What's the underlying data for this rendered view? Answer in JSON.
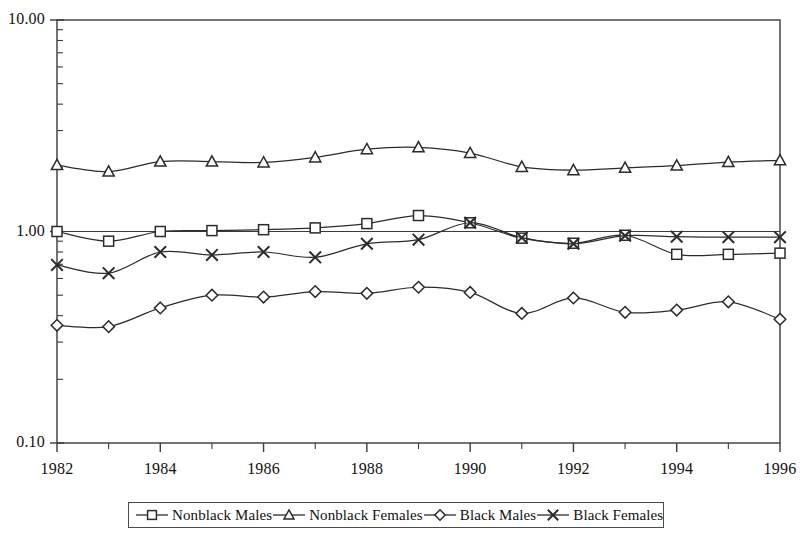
{
  "chart_data": {
    "type": "line",
    "title": "",
    "subtitle": "",
    "xlabel": "",
    "ylabel": "",
    "yscale": "log",
    "ylim": [
      0.1,
      10.0
    ],
    "ytick_labels": [
      "10.00",
      "1.00",
      "0.10"
    ],
    "ytick_values": [
      10.0,
      1.0,
      0.1
    ],
    "xlim": [
      1982,
      1996
    ],
    "x": [
      1982,
      1983,
      1984,
      1985,
      1986,
      1987,
      1988,
      1989,
      1990,
      1991,
      1992,
      1993,
      1994,
      1995,
      1996
    ],
    "xtick_labels": [
      "1982",
      "1984",
      "1986",
      "1988",
      "1990",
      "1992",
      "1994",
      "1996"
    ],
    "xtick_values": [
      1982,
      1984,
      1986,
      1988,
      1990,
      1992,
      1994,
      1996
    ],
    "grid": false,
    "legend_position": "bottom",
    "reference_line": 1.0,
    "series": [
      {
        "name": "Nonblack Males",
        "marker": "square",
        "values": [
          1.0,
          0.9,
          1.0,
          1.01,
          1.02,
          1.04,
          1.09,
          1.19,
          1.1,
          0.93,
          0.88,
          0.96,
          0.78,
          0.78,
          0.79
        ]
      },
      {
        "name": "Nonblack Females",
        "marker": "triangle",
        "values": [
          2.06,
          1.92,
          2.14,
          2.14,
          2.12,
          2.24,
          2.45,
          2.5,
          2.35,
          2.02,
          1.95,
          2.0,
          2.05,
          2.13,
          2.17
        ]
      },
      {
        "name": "Black Males",
        "marker": "diamond",
        "values": [
          0.36,
          0.355,
          0.435,
          0.5,
          0.49,
          0.52,
          0.51,
          0.545,
          0.515,
          0.41,
          0.485,
          0.415,
          0.425,
          0.465,
          0.385
        ]
      },
      {
        "name": "Black Females",
        "marker": "cross",
        "values": [
          0.695,
          0.635,
          0.8,
          0.775,
          0.8,
          0.755,
          0.875,
          0.915,
          1.1,
          0.935,
          0.875,
          0.955,
          0.945,
          0.94,
          0.94
        ]
      }
    ]
  },
  "legend": {
    "entries": [
      {
        "label": "Nonblack Males",
        "marker": "square-marker-icon"
      },
      {
        "label": "Nonblack Females",
        "marker": "triangle-marker-icon"
      },
      {
        "label": "Black Males",
        "marker": "diamond-marker-icon"
      },
      {
        "label": "Black Females",
        "marker": "cross-marker-icon"
      }
    ]
  },
  "colors": {
    "line": "#2b2b2b",
    "axis": "#3a3a3a",
    "text": "#111111",
    "background": "#ffffff"
  }
}
